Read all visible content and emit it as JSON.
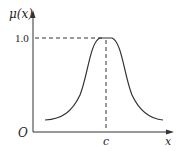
{
  "diagram": {
    "type": "membership-function",
    "shape": "bell",
    "y_axis_label": "μ(x)",
    "x_axis_label": "x",
    "origin_label": "O",
    "peak_value_label": "1.0",
    "center_label": "c",
    "colors": {
      "line": "#333333",
      "background": "#ffffff"
    }
  }
}
